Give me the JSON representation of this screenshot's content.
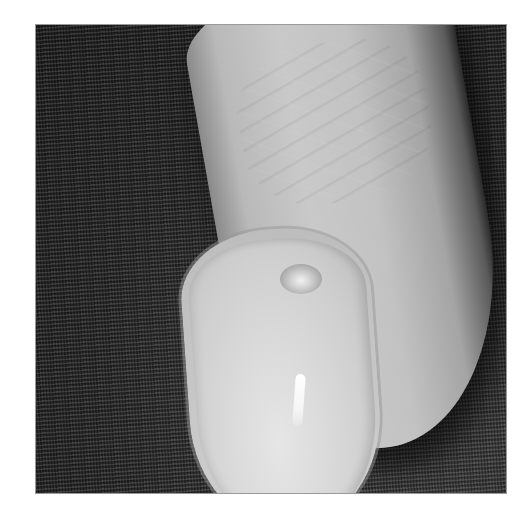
{
  "image": {
    "subject": "Fingertip with nail on dark woven fabric",
    "color_mode": "grayscale",
    "colors": {
      "background": "#ffffff",
      "fabric": "#2c2c2c",
      "skin": "#c2c2c2",
      "nail": "#dadada",
      "highlight": "#ffffff",
      "shadow": "#111111"
    }
  }
}
